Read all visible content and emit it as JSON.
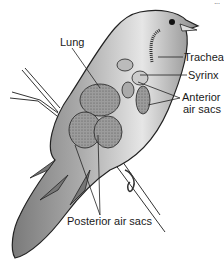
{
  "figure": {
    "corner_text": "..."
  },
  "labels": {
    "lung": "Lung",
    "trachea": "Trachea",
    "syrinx": "Syrinx",
    "anterior_line1": "Anterior",
    "anterior_line2": "air sacs",
    "posterior": "Posterior air sacs"
  },
  "colors": {
    "body": "#9a9a9a",
    "body_dark": "#6e6e6e",
    "body_light": "#d8d8d8",
    "organ": "#8a8a8a",
    "outline": "#222222",
    "background": "#ffffff"
  }
}
